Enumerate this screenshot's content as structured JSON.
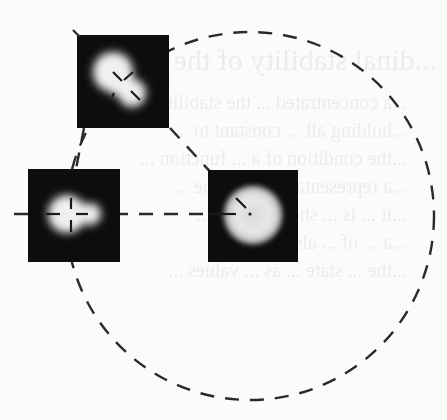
{
  "figure": {
    "colors": {
      "background": "#fbfbfa",
      "panel": "#0d0d0d",
      "blob": "#f2f2f2",
      "dash": "#2a2a2a"
    },
    "circle": {
      "cx": 250,
      "cy": 216,
      "r": 184
    },
    "panels": [
      {
        "id": "panel-top",
        "x": 77,
        "y": 35,
        "w": 92,
        "h": 93,
        "shape": "two-lobed blob (large upper-left lobe, small lower-right lobe)"
      },
      {
        "id": "panel-left",
        "x": 28,
        "y": 169,
        "w": 92,
        "h": 93,
        "shape": "two-lobed blob (large left lobe, small right lobe)"
      },
      {
        "id": "panel-right",
        "x": 208,
        "y": 170,
        "w": 90,
        "h": 92,
        "shape": "single round diffuse disc"
      }
    ]
  },
  "ghost_text": {
    "heading": "...dinal stability of the ...",
    "lines": [
      "...a concentrated ... the stability ...",
      "...holding all ... constant to ...",
      "...the condition of a ... function ...",
      "...a representation ... of the ...",
      "...it ... is ... shown ... the ...",
      "...a ... of ... also ... in ...",
      "...the ... state ... as ... values ..."
    ]
  }
}
